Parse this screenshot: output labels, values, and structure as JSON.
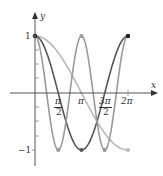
{
  "chart_data": {
    "type": "line",
    "title": "",
    "xlabel": "x",
    "ylabel": "y",
    "xlim": [
      0,
      6.2832
    ],
    "ylim": [
      -1,
      1
    ],
    "x_ticks": [
      "π/2",
      "π",
      "3π/2",
      "2π"
    ],
    "y_ticks": [
      "1",
      "−1"
    ],
    "grid": false,
    "legend": null,
    "series": [
      {
        "name": "cos(x/2)",
        "color": "#b8b8b8",
        "x": [
          0,
          1.5708,
          3.1416,
          4.7124,
          6.2832
        ],
        "values": [
          1,
          0.707,
          0,
          -0.707,
          -1
        ]
      },
      {
        "name": "cos(x)",
        "color": "#555555",
        "x": [
          0,
          1.5708,
          3.1416,
          4.7124,
          6.2832
        ],
        "values": [
          1,
          0,
          -1,
          0,
          1
        ]
      },
      {
        "name": "cos(2x)",
        "color": "#9a9a9a",
        "x": [
          0,
          0.7854,
          1.5708,
          2.3562,
          3.1416,
          3.927,
          4.7124,
          5.4978,
          6.2832
        ],
        "values": [
          1,
          0,
          -1,
          0,
          1,
          0,
          -1,
          0,
          1
        ]
      }
    ]
  },
  "labels": {
    "x_axis": "x",
    "y_axis": "y",
    "y_one": "1",
    "y_neg_one": "−1",
    "pi_num": "π",
    "two": "2",
    "pi": "π",
    "three_pi": "3π",
    "two_pi": "2π"
  }
}
